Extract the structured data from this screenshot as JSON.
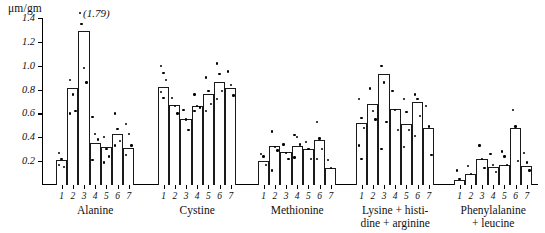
{
  "figure": {
    "unit_label": "μm/gm",
    "outlier_annotation": "(1.79)"
  },
  "chart_data": {
    "type": "bar",
    "title": "",
    "subtitle": "",
    "xlabel": "",
    "ylabel": "μm/gm",
    "ylim": [
      0,
      1.4
    ],
    "ytick_labels": [
      "0.2",
      "0.4",
      "0.6",
      "0.8",
      "1.0",
      "1.2",
      "1.4"
    ],
    "ytick_values": [
      0.2,
      0.4,
      0.6,
      0.8,
      1.0,
      1.2,
      1.4
    ],
    "grid": false,
    "legend": null,
    "annotations": [
      {
        "text": "(1.79)",
        "note": "off-scale value marked with a dot above the Alanine group"
      }
    ],
    "categories": [
      "1",
      "2",
      "3",
      "4",
      "5",
      "6",
      "7"
    ],
    "groups": [
      {
        "name": "Alanine",
        "caption": "Alanine",
        "values": [
          0.21,
          0.81,
          1.29,
          0.35,
          0.32,
          0.43,
          0.31
        ],
        "points": [
          [
            0.27,
            0.22,
            0.15,
            0.17
          ],
          [
            0.88,
            0.76,
            0.62,
            0.6
          ],
          [
            1.35,
            0.98,
            0.86
          ],
          [
            0.57,
            0.43,
            0.38,
            0.21
          ],
          [
            0.4,
            0.3,
            0.24,
            0.19
          ],
          [
            0.6,
            0.47,
            0.37,
            0.33
          ],
          [
            0.51,
            0.43,
            0.33,
            0.25
          ]
        ]
      },
      {
        "name": "Cystine",
        "caption": "Cystine",
        "values": [
          0.82,
          0.67,
          0.55,
          0.66,
          0.76,
          0.86,
          0.81
        ],
        "points": [
          [
            1.0,
            0.94,
            0.88,
            0.78,
            0.73
          ],
          [
            0.73,
            0.66,
            0.6
          ],
          [
            0.63,
            0.55,
            0.46
          ],
          [
            0.76,
            0.66,
            0.65,
            0.62
          ],
          [
            0.9,
            0.79,
            0.68,
            0.62
          ],
          [
            1.02,
            0.93,
            0.79,
            0.72
          ],
          [
            0.95,
            0.84,
            0.75
          ]
        ]
      },
      {
        "name": "Methionine",
        "caption": "Methionine",
        "values": [
          0.2,
          0.33,
          0.28,
          0.33,
          0.3,
          0.38,
          0.14
        ],
        "points": [
          [
            0.26,
            0.24,
            0.17
          ],
          [
            0.45,
            0.32,
            0.29,
            0.12
          ],
          [
            0.34,
            0.27,
            0.22
          ],
          [
            0.42,
            0.4,
            0.34,
            0.23
          ],
          [
            0.36,
            0.3,
            0.22
          ],
          [
            0.53,
            0.39,
            0.3,
            0.22
          ],
          [
            0.21,
            0.14
          ]
        ]
      },
      {
        "name": "Lysine + histidine + arginine",
        "caption": "Lysine + histi-\ndine + arginine",
        "values": [
          0.52,
          0.68,
          0.93,
          0.64,
          0.51,
          0.7,
          0.48
        ],
        "points": [
          [
            0.72,
            0.56,
            0.48,
            0.33,
            0.22
          ],
          [
            0.81,
            0.62,
            0.55
          ],
          [
            1.0,
            0.86,
            0.53,
            0.3
          ],
          [
            0.79,
            0.63,
            0.46
          ],
          [
            0.72,
            0.61,
            0.46,
            0.32
          ],
          [
            0.76,
            0.72,
            0.58,
            0.41
          ],
          [
            0.66,
            0.49,
            0.25
          ]
        ]
      },
      {
        "name": "Phenylalanine + leucine",
        "caption": "Phenylalanine\n+ leucine",
        "values": [
          0.04,
          0.09,
          0.22,
          0.15,
          0.17,
          0.48,
          0.16
        ],
        "points": [
          [
            0.12,
            0.05
          ],
          [
            0.16,
            0.09
          ],
          [
            0.33,
            0.22,
            0.14
          ],
          [
            0.26,
            0.17,
            0.11
          ],
          [
            0.28,
            0.24,
            0.17
          ],
          [
            0.63,
            0.49,
            0.2
          ],
          [
            0.27,
            0.19,
            0.12
          ]
        ]
      }
    ]
  }
}
